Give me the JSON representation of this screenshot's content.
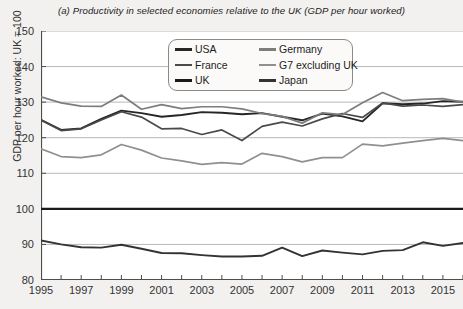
{
  "chart_data": {
    "type": "line",
    "title": "(a) Productivity in selected economies relative to the UK (GDP per hour worked)",
    "xlabel": "",
    "ylabel": "GDP per hour worked: UK = 100",
    "ylim": [
      80,
      150
    ],
    "ytick_values": [
      80,
      90,
      100,
      110,
      120,
      130,
      140,
      150
    ],
    "ytick_labels": [
      "80",
      "90",
      "100",
      "110",
      "120",
      "130",
      "140",
      "150"
    ],
    "xlim": [
      1995,
      2016
    ],
    "x": [
      1995,
      1996,
      1997,
      1998,
      1999,
      2000,
      2001,
      2002,
      2003,
      2004,
      2005,
      2006,
      2007,
      2008,
      2009,
      2010,
      2011,
      2012,
      2013,
      2014,
      2015,
      2016
    ],
    "xtick_values": [
      1995,
      1996,
      1997,
      1998,
      1999,
      2000,
      2001,
      2002,
      2003,
      2004,
      2005,
      2006,
      2007,
      2008,
      2009,
      2010,
      2011,
      2012,
      2013,
      2014,
      2015,
      2016
    ],
    "xtick_labels": [
      "1995",
      "",
      "1997",
      "",
      "1999",
      "",
      "2001",
      "",
      "2003",
      "",
      "2005",
      "",
      "2007",
      "",
      "2009",
      "",
      "2011",
      "",
      "2013",
      "",
      "2015",
      ""
    ],
    "grid": true,
    "legend_position": "upper-center",
    "series": [
      {
        "name": "USA",
        "color": "#262626",
        "width": 1.9,
        "values": [
          125.0,
          122.2,
          122.6,
          125.3,
          127.6,
          126.9,
          125.9,
          126.4,
          127.2,
          127.0,
          126.6,
          126.9,
          125.9,
          124.9,
          126.8,
          126.0,
          124.6,
          129.7,
          129.4,
          129.6,
          130.3,
          130.1
        ]
      },
      {
        "name": "France",
        "color": "#4a4a4a",
        "width": 1.7,
        "values": [
          125.0,
          122.0,
          122.5,
          125.0,
          127.3,
          125.8,
          122.5,
          122.6,
          120.9,
          122.2,
          119.2,
          123.2,
          124.4,
          123.3,
          125.3,
          126.8,
          125.7,
          129.8,
          128.9,
          129.2,
          128.8,
          129.3
        ]
      },
      {
        "name": "UK",
        "color": "#1a1a1a",
        "width": 2.2,
        "values": [
          100,
          100,
          100,
          100,
          100,
          100,
          100,
          100,
          100,
          100,
          100,
          100,
          100,
          100,
          100,
          100,
          100,
          100,
          100,
          100,
          100,
          100
        ]
      },
      {
        "name": "Germany",
        "color": "#7d7d7d",
        "width": 1.7,
        "values": [
          131.5,
          129.8,
          128.9,
          128.8,
          132.0,
          128.0,
          129.3,
          128.2,
          128.7,
          128.7,
          128.1,
          126.8,
          126.0,
          124.1,
          127.0,
          126.5,
          129.8,
          132.7,
          130.4,
          130.8,
          131.0,
          130.0
        ]
      },
      {
        "name": "G7 excluding UK",
        "color": "#909090",
        "width": 1.7,
        "values": [
          116.9,
          114.7,
          114.4,
          115.2,
          118.1,
          116.5,
          114.3,
          113.5,
          112.5,
          113.0,
          112.6,
          115.6,
          114.7,
          113.2,
          114.4,
          114.4,
          118.2,
          117.7,
          118.5,
          119.2,
          119.8,
          119.2
        ]
      },
      {
        "name": "Japan",
        "color": "#333333",
        "width": 1.9,
        "values": [
          91.1,
          90.0,
          89.2,
          89.1,
          89.9,
          88.8,
          87.6,
          87.5,
          87.0,
          86.6,
          86.6,
          86.8,
          89.1,
          86.7,
          88.3,
          87.7,
          87.2,
          88.2,
          88.4,
          90.6,
          89.6,
          90.4
        ]
      }
    ]
  },
  "legend": {
    "entries": [
      {
        "label": "USA",
        "color": "#262626"
      },
      {
        "label": "Germany",
        "color": "#7d7d7d"
      },
      {
        "label": "France",
        "color": "#4a4a4a"
      },
      {
        "label": "G7 excluding UK",
        "color": "#909090"
      },
      {
        "label": "UK",
        "color": "#1a1a1a"
      },
      {
        "label": "Japan",
        "color": "#333333"
      }
    ]
  },
  "colors": {
    "background": "#f2f1ef",
    "plot_background": "#ffffff",
    "grid": "#b8b8b8",
    "axis": "#4d4d4d",
    "text": "#333333"
  }
}
